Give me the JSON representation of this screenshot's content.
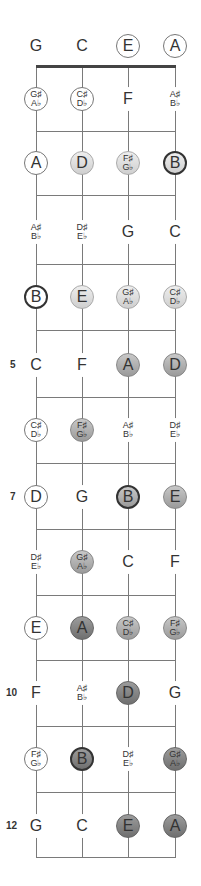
{
  "diagram": {
    "strings": [
      "G",
      "C",
      "E",
      "A"
    ],
    "string_x": [
      36,
      82,
      128,
      175
    ],
    "row_y": [
      46,
      99,
      163,
      232,
      297,
      365,
      430,
      497,
      562,
      628,
      693,
      759,
      826
    ],
    "fret_y": [
      66,
      131,
      195,
      264,
      330,
      397,
      463,
      529,
      595,
      660,
      726,
      792,
      857
    ],
    "fret_numbers": [
      {
        "fret": 5,
        "label": "5"
      },
      {
        "fret": 7,
        "label": "7"
      },
      {
        "fret": 10,
        "label": "10"
      },
      {
        "fret": 12,
        "label": "12"
      }
    ],
    "rows": [
      [
        {
          "t": [
            "G"
          ],
          "s": "plain"
        },
        {
          "t": [
            "C"
          ],
          "s": "plain"
        },
        {
          "t": [
            "E"
          ],
          "s": "outline"
        },
        {
          "t": [
            "A"
          ],
          "s": "outline"
        }
      ],
      [
        {
          "t": [
            "G♯",
            "A♭"
          ],
          "s": "outline"
        },
        {
          "t": [
            "C♯",
            "D♭"
          ],
          "s": "outline"
        },
        {
          "t": [
            "F"
          ],
          "s": "plain"
        },
        {
          "t": [
            "A♯",
            "B♭"
          ],
          "s": "plain"
        }
      ],
      [
        {
          "t": [
            "A"
          ],
          "s": "outline"
        },
        {
          "t": [
            "D"
          ],
          "s": "s1"
        },
        {
          "t": [
            "F♯",
            "G♭"
          ],
          "s": "s1"
        },
        {
          "t": [
            "B"
          ],
          "s": "s1 root"
        }
      ],
      [
        {
          "t": [
            "A♯",
            "B♭"
          ],
          "s": "plain"
        },
        {
          "t": [
            "D♯",
            "E♭"
          ],
          "s": "plain"
        },
        {
          "t": [
            "G"
          ],
          "s": "plain"
        },
        {
          "t": [
            "C"
          ],
          "s": "plain"
        }
      ],
      [
        {
          "t": [
            "B"
          ],
          "s": "root"
        },
        {
          "t": [
            "E"
          ],
          "s": "s1"
        },
        {
          "t": [
            "G♯",
            "A♭"
          ],
          "s": "s1"
        },
        {
          "t": [
            "C♯",
            "D♭"
          ],
          "s": "s1"
        }
      ],
      [
        {
          "t": [
            "C"
          ],
          "s": "plain"
        },
        {
          "t": [
            "F"
          ],
          "s": "plain"
        },
        {
          "t": [
            "A"
          ],
          "s": "s2"
        },
        {
          "t": [
            "D"
          ],
          "s": "s2"
        }
      ],
      [
        {
          "t": [
            "C♯",
            "D♭"
          ],
          "s": "outline"
        },
        {
          "t": [
            "F♯",
            "G♭"
          ],
          "s": "s2"
        },
        {
          "t": [
            "A♯",
            "B♭"
          ],
          "s": "plain"
        },
        {
          "t": [
            "D♯",
            "E♭"
          ],
          "s": "plain"
        }
      ],
      [
        {
          "t": [
            "D"
          ],
          "s": "outline"
        },
        {
          "t": [
            "G"
          ],
          "s": "plain"
        },
        {
          "t": [
            "B"
          ],
          "s": "s2 root"
        },
        {
          "t": [
            "E"
          ],
          "s": "s2"
        }
      ],
      [
        {
          "t": [
            "D♯",
            "E♭"
          ],
          "s": "plain"
        },
        {
          "t": [
            "G♯",
            "A♭"
          ],
          "s": "s2"
        },
        {
          "t": [
            "C"
          ],
          "s": "plain"
        },
        {
          "t": [
            "F"
          ],
          "s": "plain"
        }
      ],
      [
        {
          "t": [
            "E"
          ],
          "s": "outline"
        },
        {
          "t": [
            "A"
          ],
          "s": "s3"
        },
        {
          "t": [
            "C♯",
            "D♭"
          ],
          "s": "s2"
        },
        {
          "t": [
            "F♯",
            "G♭"
          ],
          "s": "s2"
        }
      ],
      [
        {
          "t": [
            "F"
          ],
          "s": "plain"
        },
        {
          "t": [
            "A♯",
            "B♭"
          ],
          "s": "plain"
        },
        {
          "t": [
            "D"
          ],
          "s": "s3"
        },
        {
          "t": [
            "G"
          ],
          "s": "plain"
        }
      ],
      [
        {
          "t": [
            "F♯",
            "G♭"
          ],
          "s": "outline"
        },
        {
          "t": [
            "B"
          ],
          "s": "s3 root"
        },
        {
          "t": [
            "D♯",
            "E♭"
          ],
          "s": "plain"
        },
        {
          "t": [
            "G♯",
            "A♭"
          ],
          "s": "s3"
        }
      ],
      [
        {
          "t": [
            "G"
          ],
          "s": "plain"
        },
        {
          "t": [
            "C"
          ],
          "s": "plain"
        },
        {
          "t": [
            "E"
          ],
          "s": "s3"
        },
        {
          "t": [
            "A"
          ],
          "s": "s3"
        }
      ]
    ]
  }
}
